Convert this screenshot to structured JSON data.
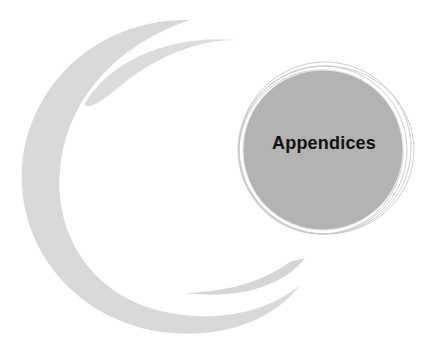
{
  "page": {
    "title": "Appendices"
  },
  "colors": {
    "background": "#ffffff",
    "swoosh": "#d9d9d9",
    "disc": "#b3b3b3",
    "ring_lines": "#c8c8c8",
    "title_text": "#111111"
  },
  "decorations": {
    "outer_swoosh_icon": "crescent-swoosh",
    "inner_swoosh_icon": "crescent-swoosh",
    "disc_icon": "sketched-circle"
  }
}
